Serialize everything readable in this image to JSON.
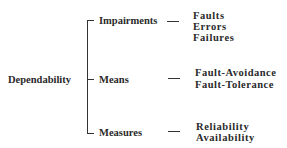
{
  "root": {
    "label": "Dependability"
  },
  "branches": [
    {
      "label": "Impairments",
      "items": [
        "Faults",
        "Errors",
        "Failures"
      ]
    },
    {
      "label": "Means",
      "items": [
        "Fault-Avoidance",
        "Fault-Tolerance"
      ]
    },
    {
      "label": "Measures",
      "items": [
        "Reliability",
        "Availability"
      ]
    }
  ]
}
